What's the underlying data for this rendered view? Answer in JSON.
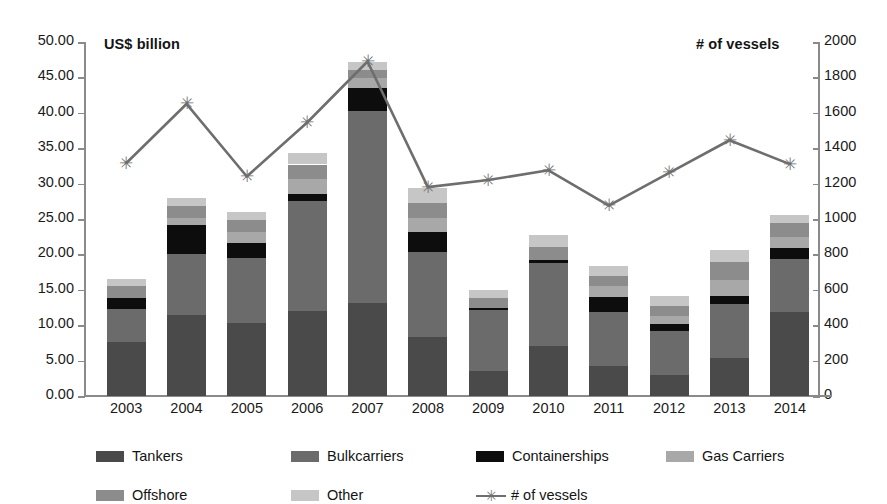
{
  "chart_data": {
    "type": "bar",
    "title": "",
    "subtitle": "",
    "xlabel": "",
    "ylabel": "US$ billion",
    "y2label": "# of vessels",
    "categories": [
      "2003",
      "2004",
      "2005",
      "2006",
      "2007",
      "2008",
      "2009",
      "2010",
      "2011",
      "2012",
      "2013",
      "2014"
    ],
    "ylim": [
      0,
      50
    ],
    "y2lim": [
      0,
      2000
    ],
    "yticks": [
      "0.00",
      "5.00",
      "10.00",
      "15.00",
      "20.00",
      "25.00",
      "30.00",
      "35.00",
      "40.00",
      "45.00",
      "50.00"
    ],
    "y2ticks": [
      "0",
      "200",
      "400",
      "600",
      "800",
      "1000",
      "1200",
      "1400",
      "1600",
      "1800",
      "2000"
    ],
    "grid": false,
    "legend_position": "bottom",
    "stacked": true,
    "series": [
      {
        "name": "Tankers",
        "color": "#4a4a4a",
        "axis": "left",
        "values": [
          7.6,
          11.5,
          10.3,
          12.0,
          13.1,
          8.4,
          3.5,
          7.0,
          4.3,
          3.0,
          5.4,
          11.9
        ]
      },
      {
        "name": "Bulkcarriers",
        "color": "#6b6b6b",
        "axis": "left",
        "values": [
          4.7,
          8.6,
          9.2,
          15.5,
          27.2,
          12.0,
          8.6,
          11.8,
          7.6,
          6.2,
          7.6,
          7.4
        ]
      },
      {
        "name": "Containerships",
        "color": "#0d0d0d",
        "axis": "left",
        "values": [
          1.6,
          4.0,
          2.1,
          1.1,
          3.2,
          2.8,
          0.4,
          0.4,
          2.1,
          1.0,
          1.1,
          1.6
        ]
      },
      {
        "name": "Gas Carriers",
        "color": "#a8a8a8",
        "axis": "left",
        "values": [
          0.0,
          1.1,
          1.5,
          2.0,
          1.4,
          1.9,
          0.0,
          0.0,
          1.5,
          1.1,
          2.3,
          1.5
        ]
      },
      {
        "name": "Offshore",
        "color": "#8c8c8c",
        "axis": "left",
        "values": [
          1.6,
          1.6,
          1.8,
          2.1,
          1.1,
          2.2,
          1.3,
          1.9,
          1.5,
          1.4,
          2.5,
          2.0
        ]
      },
      {
        "name": "Other",
        "color": "#c6c6c6",
        "axis": "left",
        "values": [
          1.0,
          1.2,
          1.1,
          1.6,
          1.2,
          2.1,
          1.2,
          1.6,
          1.4,
          1.4,
          1.7,
          1.1
        ]
      },
      {
        "name": "# of vessels",
        "color": "#6e6e6e",
        "axis": "right",
        "type": "line",
        "marker": "asterisk",
        "values": [
          1315,
          1650,
          1240,
          1545,
          1890,
          1180,
          1220,
          1275,
          1075,
          1260,
          1445,
          1310
        ]
      }
    ]
  },
  "legend": {
    "items": [
      {
        "label": "Tankers"
      },
      {
        "label": "Bulkcarriers"
      },
      {
        "label": "Containerships"
      },
      {
        "label": "Gas Carriers"
      },
      {
        "label": "Offshore"
      },
      {
        "label": "Other"
      },
      {
        "label": "# of vessels"
      }
    ]
  }
}
